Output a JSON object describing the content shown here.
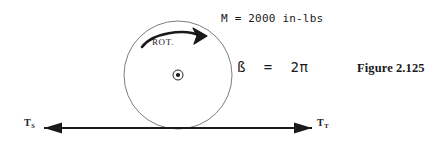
{
  "figure": {
    "caption": "Figure 2.125",
    "background_color": "#ffffff",
    "ink_color": "#1a1a1a"
  },
  "annotations": {
    "moment": "M = 2000 in-lbs",
    "angle": "ß  =  2π",
    "rotation": "ROT."
  },
  "forces": {
    "left": {
      "symbol": "T",
      "subscript": "S"
    },
    "right": {
      "symbol": "T",
      "subscript": "T"
    }
  },
  "geometry": {
    "circle": {
      "cx": 178,
      "cy": 75,
      "r": 54
    },
    "axis_marker": {
      "cx": 178,
      "cy": 75,
      "outer_r": 5,
      "dot_r": 2
    },
    "force_line": {
      "x1": 44,
      "x2": 312,
      "y": 128
    }
  }
}
